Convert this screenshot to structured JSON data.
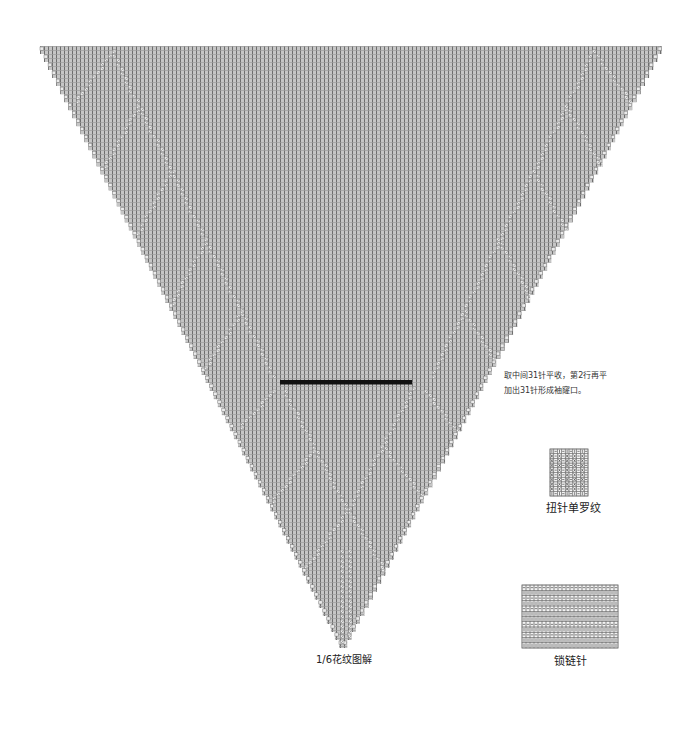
{
  "diagram": {
    "title": "1/6花纹图解",
    "triangle": {
      "top_y": 46,
      "left_x": 40,
      "right_x": 662,
      "apex_x": 343,
      "apex_y": 648,
      "steps": 75,
      "cell": 4
    },
    "cast_off_bar": {
      "x": 280,
      "y": 380,
      "width": 132,
      "height": 4.5
    },
    "pattern_lines": [
      [
        110,
        50,
        272,
        375
      ],
      [
        110,
        50,
        74,
        100
      ],
      [
        137,
        105,
        103,
        165
      ],
      [
        170,
        170,
        136,
        232
      ],
      [
        205,
        238,
        170,
        302
      ],
      [
        240,
        310,
        204,
        366
      ],
      [
        592,
        50,
        430,
        375
      ],
      [
        592,
        50,
        628,
        100
      ],
      [
        565,
        105,
        599,
        165
      ],
      [
        532,
        170,
        566,
        232
      ],
      [
        497,
        238,
        532,
        302
      ],
      [
        462,
        310,
        498,
        366
      ],
      [
        283,
        390,
        343,
        503
      ],
      [
        343,
        503,
        384,
        570
      ],
      [
        412,
        387,
        350,
        503
      ],
      [
        350,
        503,
        305,
        565
      ],
      [
        272,
        390,
        238,
        426
      ],
      [
        424,
        390,
        458,
        433
      ],
      [
        312,
        450,
        270,
        500
      ],
      [
        383,
        447,
        423,
        497
      ],
      [
        339,
        550,
        339,
        640
      ],
      [
        346,
        550,
        346,
        640
      ]
    ]
  },
  "annotation": {
    "line1": "取中间31针平收，第2行再平",
    "line2": "加出31针形成袖窿口。"
  },
  "legend": [
    {
      "name": "扭针单罗纹",
      "x": 550,
      "y": 449,
      "cell_w": 3.8,
      "cell_h": 4.7,
      "rows": [
        "I-I-I-I-I-",
        "X-X-X-X-X-",
        "X-X-X-X-X-",
        "X-X-X-X-X-",
        "X-X-X-X-X-",
        "X-X-X-X-X-",
        "X-X-X-X-X-",
        "X-X-X-X-X-",
        "X-X-X-X-X-",
        "I-I-I-I-I-"
      ]
    },
    {
      "name": "锁链针",
      "x": 522,
      "y": 585,
      "cell_w": 4,
      "cell_h": 5.25,
      "rows": [
        "------------------------",
        "IIIIIIIIIIIIIIIIIIIIIIII",
        "------------------------",
        "IIIIIIIIIIIIIIIIIIIIIIII",
        "------------------------",
        "IIIIIIIIIIIIIIIIIIIIIIII",
        "IIIIIIIIIIIIIIIIIIIIIIII",
        "------------------------",
        "IIIIIIIIIIIIIIIIIIIIIIII",
        "------------------------",
        "IIIIIIIIIIIIIIIIIIIIIIII",
        "IIIIIIIIIIIIIIIIIIIIIIII"
      ]
    }
  ],
  "colors": {
    "grid_fill": "#c6c6c6",
    "grid_line_v": "#6e6e6e",
    "grid_line_h": "#9c9c9c",
    "symbol_fill": "#ebebeb",
    "symbol_stroke": "#7a7a7a",
    "bar": "#111111",
    "legend_line": "#777777",
    "legend_symbol": "#333333"
  }
}
